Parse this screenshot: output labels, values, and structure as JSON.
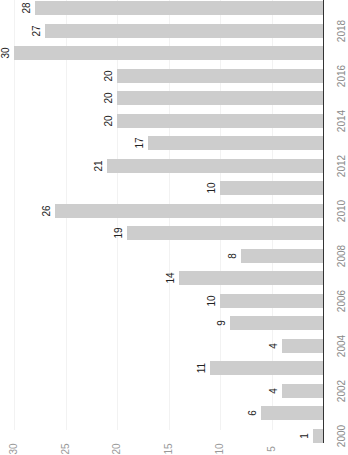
{
  "chart_data": {
    "type": "bar",
    "orientation": "rotated-90-clockwise (vertical bars rendered horizontally)",
    "title": "",
    "xlabel": "",
    "ylabel": "",
    "categories": [
      "2000",
      "2001",
      "2002",
      "2003",
      "2004",
      "2005",
      "2006",
      "2007",
      "2008",
      "2009",
      "2010",
      "2011",
      "2012",
      "2013",
      "2014",
      "2015",
      "2016",
      "2017",
      "2018",
      "2019"
    ],
    "values": [
      1,
      6,
      4,
      11,
      4,
      9,
      10,
      14,
      8,
      19,
      26,
      10,
      21,
      17,
      20,
      20,
      20,
      30,
      27,
      28
    ],
    "category_tick_labels": [
      "2000",
      "2002",
      "2004",
      "2006",
      "2008",
      "2010",
      "2012",
      "2014",
      "2016",
      "2018"
    ],
    "value_tick_labels": [
      "5",
      "10",
      "15",
      "20",
      "25",
      "30"
    ],
    "ylim": [
      0,
      30
    ],
    "grid": true,
    "bar_color": "#cdcdcd",
    "data_labels": true
  }
}
